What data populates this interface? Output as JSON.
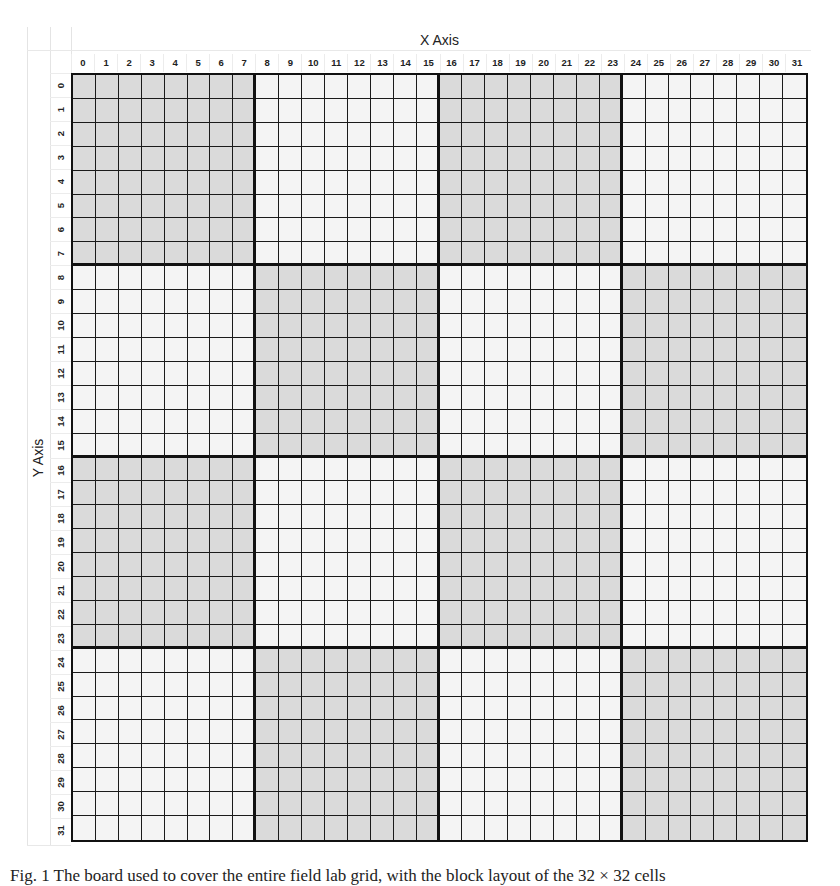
{
  "axes": {
    "x_title": "X Axis",
    "y_title": "Y Axis",
    "x_ticks": [
      "0",
      "1",
      "2",
      "3",
      "4",
      "5",
      "6",
      "7",
      "8",
      "9",
      "10",
      "11",
      "12",
      "13",
      "14",
      "15",
      "16",
      "17",
      "18",
      "19",
      "20",
      "21",
      "22",
      "23",
      "24",
      "25",
      "26",
      "27",
      "28",
      "29",
      "30",
      "31"
    ],
    "y_ticks": [
      "0",
      "1",
      "2",
      "3",
      "4",
      "5",
      "6",
      "7",
      "8",
      "9",
      "10",
      "11",
      "12",
      "13",
      "14",
      "15",
      "16",
      "17",
      "18",
      "19",
      "20",
      "21",
      "22",
      "23",
      "24",
      "25",
      "26",
      "27",
      "28",
      "29",
      "30",
      "31"
    ]
  },
  "grid": {
    "columns": 32,
    "rows": 32,
    "block_size": 8,
    "shading_rule": "block (row/8 + col/8) even = shaded",
    "shaded_blocks": [
      [
        0,
        0
      ],
      [
        0,
        2
      ],
      [
        1,
        1
      ],
      [
        1,
        3
      ],
      [
        2,
        0
      ],
      [
        2,
        2
      ],
      [
        3,
        1
      ],
      [
        3,
        3
      ]
    ],
    "colors": {
      "shaded": "#dadada",
      "light": "#f4f4f4",
      "line": "#111111"
    }
  },
  "caption": {
    "text": "Fig. 1   The board used to cover the entire field lab grid, with the block layout of the 32 × 32 cells"
  }
}
